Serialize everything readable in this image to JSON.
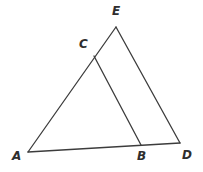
{
  "figure": {
    "width": 203,
    "height": 172,
    "background_color": "#ffffff",
    "stroke_color": "#3c3c3c",
    "stroke_width": 1.3,
    "label_color": "#2e2e2e"
  },
  "points": [
    {
      "name": "A",
      "label": "A",
      "x": 28,
      "y": 152,
      "label_x": 12,
      "label_y": 150
    },
    {
      "name": "B",
      "label": "B",
      "x": 141,
      "y": 145,
      "label_x": 137,
      "label_y": 150
    },
    {
      "name": "C",
      "label": "C",
      "x": 94,
      "y": 56,
      "label_x": 79,
      "label_y": 38
    },
    {
      "name": "D",
      "label": "D",
      "x": 180,
      "y": 143,
      "label_x": 182,
      "label_y": 149
    },
    {
      "name": "E",
      "label": "E",
      "x": 116,
      "y": 27,
      "label_x": 112,
      "label_y": 5
    }
  ],
  "segments": [
    {
      "name": "segment-A-E",
      "from": "A",
      "to": "E",
      "x1": 28,
      "y1": 152,
      "x2": 116,
      "y2": 27,
      "passes_through": "C"
    },
    {
      "name": "segment-E-D",
      "from": "E",
      "to": "D",
      "x1": 116,
      "y1": 27,
      "x2": 180,
      "y2": 143,
      "passes_through": ""
    },
    {
      "name": "segment-A-D",
      "from": "A",
      "to": "D",
      "x1": 28,
      "y1": 152,
      "x2": 180,
      "y2": 143,
      "passes_through": "B"
    },
    {
      "name": "segment-C-B",
      "from": "C",
      "to": "B",
      "x1": 94,
      "y1": 56,
      "x2": 141,
      "y2": 145,
      "passes_through": ""
    }
  ]
}
